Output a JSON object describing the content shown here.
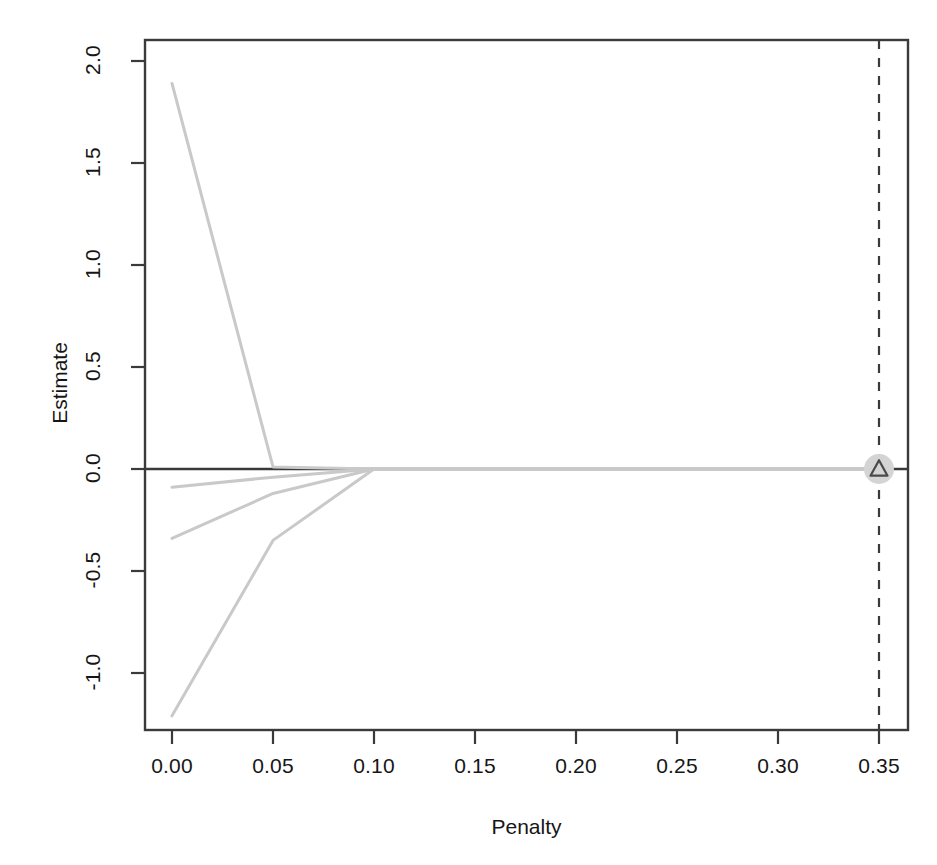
{
  "chart_data": {
    "type": "line",
    "title": "",
    "subtitle": "",
    "xlabel": "Penalty",
    "ylabel": "Estimate",
    "xlim": [
      -0.01,
      0.364
    ],
    "ylim": [
      -1.28,
      2.12
    ],
    "grid": false,
    "legend": null,
    "x_ticks": [
      "0.00",
      "0.05",
      "0.10",
      "0.15",
      "0.20",
      "0.25",
      "0.30",
      "0.35"
    ],
    "x_tick_values": [
      0.0,
      0.05,
      0.1,
      0.15,
      0.2,
      0.25,
      0.3,
      0.35
    ],
    "y_ticks": [
      "2.0",
      "1.5",
      "1.0",
      "0.5",
      "0.0",
      "-0.5",
      "-1.0"
    ],
    "y_tick_values": [
      2.0,
      1.5,
      1.0,
      0.5,
      0.0,
      -0.5,
      -1.0
    ],
    "line_color": "#c9c9c9",
    "axis_color": "#3a3a3a",
    "series": [
      {
        "name": "path-1",
        "x": [
          0.0,
          0.05,
          0.1,
          0.15,
          0.2,
          0.25,
          0.3,
          0.35
        ],
        "values": [
          1.89,
          0.01,
          0.0,
          0.0,
          0.0,
          0.0,
          0.0,
          0.0
        ]
      },
      {
        "name": "path-2",
        "x": [
          0.0,
          0.05,
          0.1,
          0.15,
          0.2,
          0.25,
          0.3,
          0.35
        ],
        "values": [
          -0.09,
          -0.04,
          0.0,
          0.0,
          0.0,
          0.0,
          0.0,
          0.0
        ]
      },
      {
        "name": "path-3",
        "x": [
          0.0,
          0.05,
          0.1,
          0.15,
          0.2,
          0.25,
          0.3,
          0.35
        ],
        "values": [
          -0.34,
          -0.12,
          0.0,
          0.0,
          0.0,
          0.0,
          0.0,
          0.0
        ]
      },
      {
        "name": "path-4",
        "x": [
          0.0,
          0.05,
          0.1,
          0.15,
          0.2,
          0.25,
          0.3,
          0.35
        ],
        "values": [
          -1.21,
          -0.35,
          0.0,
          0.0,
          0.0,
          0.0,
          0.0,
          0.0
        ]
      }
    ],
    "reference_lines": [
      {
        "name": "zero-line",
        "orientation": "horizontal",
        "value": 0.0,
        "style": "solid",
        "color": "#3a3a3a"
      },
      {
        "name": "selected-penalty-line",
        "orientation": "vertical",
        "value": 0.35,
        "style": "dashed",
        "color": "#3a3a3a"
      }
    ],
    "markers": [
      {
        "name": "selected-penalty-marker",
        "shape": "triangle-in-circle",
        "x": 0.35,
        "y": 0.0,
        "fill": "#d4d4d4",
        "stroke": "#4a4a4a"
      }
    ]
  }
}
